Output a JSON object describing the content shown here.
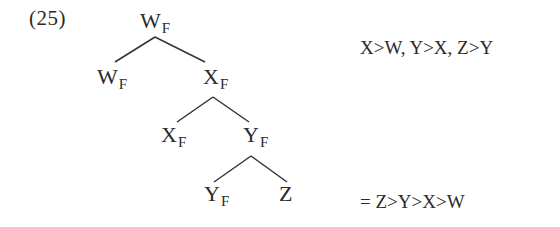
{
  "example_number": "(25)",
  "tree": {
    "nodes": [
      {
        "id": "root",
        "label": "W",
        "sub": "F",
        "x": 140,
        "y": 10
      },
      {
        "id": "w_leaf",
        "label": "W",
        "sub": "F",
        "x": 97,
        "y": 66
      },
      {
        "id": "x_node",
        "label": "X",
        "sub": "F",
        "x": 203,
        "y": 66
      },
      {
        "id": "x_leaf",
        "label": "X",
        "sub": "F",
        "x": 161,
        "y": 124
      },
      {
        "id": "y_node",
        "label": "Y",
        "sub": "F",
        "x": 243,
        "y": 124
      },
      {
        "id": "y_leaf",
        "label": "Y",
        "sub": "F",
        "x": 204,
        "y": 183
      },
      {
        "id": "z_leaf",
        "label": "Z",
        "sub": "",
        "x": 279,
        "y": 183
      }
    ],
    "edges": [
      {
        "from": "root",
        "to": "w_leaf",
        "x1": 155,
        "y1": 37,
        "x2": 115,
        "y2": 62
      },
      {
        "from": "root",
        "to": "x_node",
        "x1": 155,
        "y1": 37,
        "x2": 205,
        "y2": 62
      },
      {
        "from": "x_node",
        "to": "x_leaf",
        "x1": 213,
        "y1": 97,
        "x2": 177,
        "y2": 122
      },
      {
        "from": "x_node",
        "to": "y_node",
        "x1": 213,
        "y1": 97,
        "x2": 249,
        "y2": 122
      },
      {
        "from": "y_node",
        "to": "y_leaf",
        "x1": 251,
        "y1": 156,
        "x2": 214,
        "y2": 182
      },
      {
        "from": "y_node",
        "to": "z_leaf",
        "x1": 251,
        "y1": 156,
        "x2": 287,
        "y2": 182
      }
    ]
  },
  "annotations": {
    "top": "X>W, Y>X, Z>Y",
    "bottom": "= Z>Y>X>W"
  }
}
